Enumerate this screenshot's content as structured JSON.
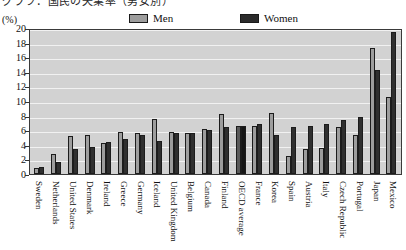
{
  "title_partial": "グラフ：国民の失業率（男女別）",
  "y_unit_label": "(%)",
  "legend": {
    "men_label": "Men",
    "women_label": "Women",
    "men_color": "#9d9d9d",
    "women_color": "#2f2f2f"
  },
  "chart_data": {
    "type": "bar",
    "title": "",
    "xlabel": "",
    "ylabel": "(%)",
    "ylim": [
      0,
      20
    ],
    "yticks": [
      0,
      2,
      4,
      6,
      8,
      10,
      12,
      14,
      16,
      18,
      20
    ],
    "grid": true,
    "legend_position": "top",
    "categories": [
      "Sweden",
      "Netherlands",
      "United States",
      "Denmark",
      "Ireland",
      "Greece",
      "Germany",
      "Iceland",
      "United Kingdom",
      "Belgium",
      "Canada",
      "Finland",
      "OECD average",
      "France",
      "Korea",
      "Spain",
      "Austria",
      "Italy",
      "Czech Republic",
      "Portugal",
      "Japan",
      "Mexico"
    ],
    "series": [
      {
        "name": "Men",
        "color": "#9d9d9d",
        "values": [
          0.8,
          2.8,
          5.2,
          5.4,
          4.2,
          5.8,
          5.6,
          7.6,
          5.8,
          5.6,
          6.2,
          8.2,
          6.6,
          6.6,
          8.4,
          2.4,
          3.4,
          3.6,
          6.4,
          5.4,
          17.3,
          10.5
        ]
      },
      {
        "name": "Women",
        "color": "#2f2f2f",
        "values": [
          0.9,
          1.6,
          3.4,
          3.7,
          4.4,
          4.8,
          5.4,
          4.5,
          5.6,
          5.6,
          6.0,
          6.5,
          6.6,
          6.8,
          5.4,
          6.4,
          6.6,
          6.8,
          7.4,
          7.8,
          14.3,
          19.5
        ]
      }
    ],
    "highlight_category": "OECD average"
  }
}
